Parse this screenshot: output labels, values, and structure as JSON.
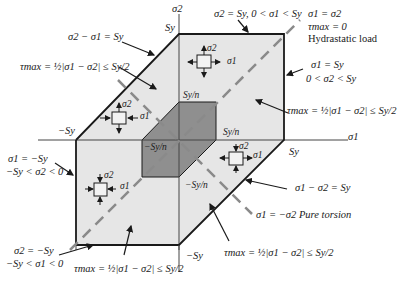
{
  "diagram": {
    "axes": {
      "x_label": "σ1",
      "y_label": "σ2"
    },
    "ticks": {
      "sy_top": "Sy",
      "sy_right": "Sy",
      "neg_sy_left": "−Sy",
      "neg_sy_bottom": "−Sy",
      "syn_top": "Sy/n",
      "syn_right": "Sy/n",
      "neg_syn_left": "−Sy/n",
      "neg_syn_bottom": "−Sy/n"
    },
    "annotations": {
      "upper_left_edge": "σ2 − σ1 = Sy",
      "upper_left_tau": "τmax = ½|σ1 − σ2| ≤ Sy/2",
      "top_edge": "σ2 = Sy, 0 < σ1 < Sy",
      "hydrostatic_line_1": "σ1 = σ2",
      "hydrostatic_line_2": "τmax = 0",
      "hydrostatic_line_3": "Hydrastatic load",
      "right_edge_1": "σ1 = Sy",
      "right_edge_2": "0 < σ2 < Sy",
      "right_tau": "τmax = ½|σ1 − σ2| ≤ Sy/2",
      "left_edge_1": "σ1 = −Sy",
      "left_edge_2": "−Sy < σ2 < 0",
      "lower_right_edge": "σ1 − σ2 = Sy",
      "pure_torsion": "σ1 = −σ2 Pure torsion",
      "bottom_edge_1": "σ2 = −Sy",
      "bottom_edge_2": "−Sy < σ1 < 0",
      "bottom_tau": "τmax = ½|σ1 − σ2| ≤ Sy/2",
      "lower_right_tau": "τmax = ½|σ1 − σ2| ≤ Sy/2"
    },
    "element_labels": {
      "s1": "σ1",
      "s2": "σ2"
    },
    "colors": {
      "outer_fill": "#e6e6e6",
      "inner_fill": "#8f8f8f",
      "outline": "#1a1a1a",
      "axis": "#444444",
      "dashed": "#8a8a8a"
    }
  }
}
